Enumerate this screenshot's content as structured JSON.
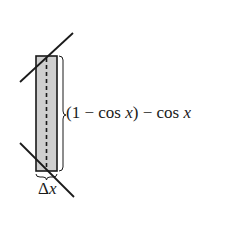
{
  "diagram": {
    "type": "area-element-between-curves",
    "colors": {
      "stroke": "#1a1a1a",
      "strip_fill": "#cfcfcf",
      "background": "#ffffff"
    },
    "height_label": {
      "open": "(1 − cos ",
      "var1": "x",
      "mid": ") − cos ",
      "var2": "x"
    },
    "width_label": {
      "delta": "Δ",
      "var": "x"
    }
  }
}
